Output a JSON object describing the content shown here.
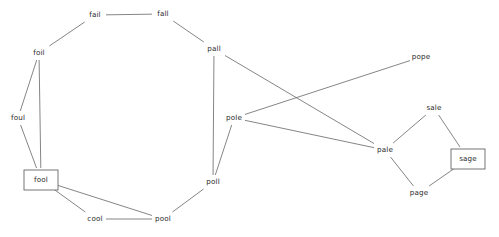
{
  "figure": {
    "background_color": "#ffffff",
    "edge_color": "#777777",
    "node_text_color": "#2b2b2b",
    "box_stroke_color": "#666666",
    "width": 499,
    "height": 237
  },
  "chart_data": {
    "type": "diagram",
    "subtype": "node-link-graph",
    "title": "",
    "xlabel": "",
    "ylabel": "",
    "layout": "spring-like free layout, pixel coordinates",
    "grid": false,
    "legend": null,
    "directed": false,
    "nodes": [
      {
        "id": "fail",
        "label": "fail",
        "x": 95,
        "y": 15,
        "boxed": false
      },
      {
        "id": "fall",
        "label": "fall",
        "x": 163,
        "y": 14,
        "boxed": false
      },
      {
        "id": "foil",
        "label": "foil",
        "x": 39,
        "y": 53,
        "boxed": false
      },
      {
        "id": "foul",
        "label": "foul",
        "x": 18,
        "y": 118,
        "boxed": false
      },
      {
        "id": "fool",
        "label": "fool",
        "x": 41,
        "y": 180,
        "boxed": true
      },
      {
        "id": "cool",
        "label": "cool",
        "x": 95,
        "y": 219,
        "boxed": false
      },
      {
        "id": "pool",
        "label": "pool",
        "x": 163,
        "y": 219,
        "boxed": false
      },
      {
        "id": "poll",
        "label": "poll",
        "x": 213,
        "y": 182,
        "boxed": false
      },
      {
        "id": "pole",
        "label": "pole",
        "x": 234,
        "y": 118,
        "boxed": false
      },
      {
        "id": "pall",
        "label": "pall",
        "x": 214,
        "y": 49,
        "boxed": false
      },
      {
        "id": "pope",
        "label": "pope",
        "x": 421,
        "y": 57,
        "boxed": false
      },
      {
        "id": "pale",
        "label": "pale",
        "x": 385,
        "y": 150,
        "boxed": false
      },
      {
        "id": "sale",
        "label": "sale",
        "x": 434,
        "y": 108,
        "boxed": false
      },
      {
        "id": "sage",
        "label": "sage",
        "x": 468,
        "y": 159,
        "boxed": true
      },
      {
        "id": "page",
        "label": "page",
        "x": 419,
        "y": 193,
        "boxed": false
      }
    ],
    "edges": [
      {
        "source": "fail",
        "target": "fall"
      },
      {
        "source": "fail",
        "target": "foil"
      },
      {
        "source": "fall",
        "target": "pall"
      },
      {
        "source": "foil",
        "target": "foul"
      },
      {
        "source": "foil",
        "target": "fool"
      },
      {
        "source": "foul",
        "target": "fool"
      },
      {
        "source": "fool",
        "target": "cool"
      },
      {
        "source": "fool",
        "target": "pool"
      },
      {
        "source": "cool",
        "target": "pool"
      },
      {
        "source": "pool",
        "target": "poll"
      },
      {
        "source": "poll",
        "target": "pole"
      },
      {
        "source": "poll",
        "target": "pall"
      },
      {
        "source": "pall",
        "target": "pale"
      },
      {
        "source": "pole",
        "target": "pope"
      },
      {
        "source": "pole",
        "target": "pale"
      },
      {
        "source": "pale",
        "target": "sale"
      },
      {
        "source": "pale",
        "target": "page"
      },
      {
        "source": "sale",
        "target": "sage"
      },
      {
        "source": "sage",
        "target": "page"
      }
    ],
    "boxed_nodes": [
      "fool",
      "sage"
    ],
    "node_count": 15,
    "edge_count": 19
  }
}
